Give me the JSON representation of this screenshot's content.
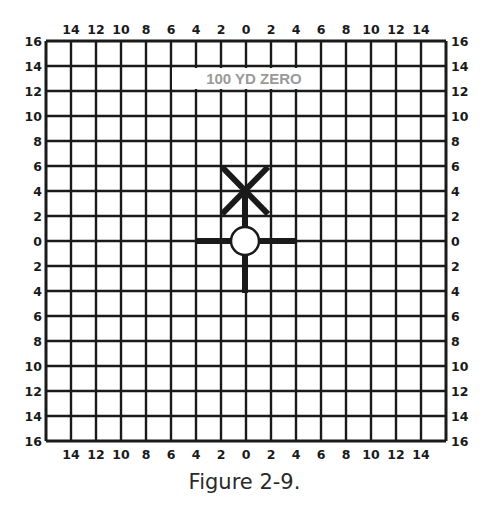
{
  "figure": {
    "title_in_grid": "100 YD ZERO",
    "caption": "Figure 2-9."
  },
  "grid": {
    "columns": 16,
    "rows": 16,
    "left": 46,
    "top": 41,
    "cell": 25,
    "line_color": "#1a1a1a",
    "top_labels": [
      "14",
      "12",
      "10",
      "8",
      "6",
      "4",
      "2",
      "0",
      "2",
      "4",
      "6",
      "8",
      "10",
      "12",
      "14"
    ],
    "bottom_labels": [
      "14",
      "12",
      "10",
      "8",
      "6",
      "4",
      "2",
      "0",
      "2",
      "4",
      "6",
      "8",
      "10",
      "12",
      "14"
    ],
    "left_labels": [
      "16",
      "14",
      "12",
      "10",
      "8",
      "6",
      "4",
      "2",
      "0",
      "2",
      "4",
      "6",
      "8",
      "10",
      "12",
      "14",
      "16"
    ],
    "right_labels": [
      "16",
      "14",
      "12",
      "10",
      "8",
      "6",
      "4",
      "2",
      "0",
      "2",
      "4",
      "6",
      "8",
      "10",
      "12",
      "14",
      "16"
    ]
  },
  "markers": {
    "aim_point": {
      "label": "circle-target",
      "grid_x": 0,
      "grid_y": 0
    },
    "impact_x": {
      "label": "strike-point",
      "grid_x": 0,
      "grid_y": 4
    }
  },
  "colors": {
    "ink": "#1a1a1a",
    "title_gray": "#9a9a9a",
    "background": "#ffffff"
  }
}
